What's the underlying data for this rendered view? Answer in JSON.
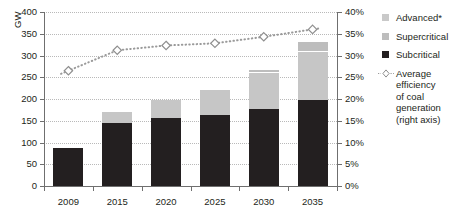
{
  "chart_data": {
    "type": "bar",
    "subtype": "stacked-bar-with-line",
    "title": "",
    "xlabel": "",
    "ylabel": "GW",
    "y2label": "",
    "categories": [
      "2009",
      "2015",
      "2020",
      "2025",
      "2030",
      "2035"
    ],
    "ylim": [
      0,
      400
    ],
    "yticks": [
      0,
      50,
      100,
      150,
      200,
      250,
      300,
      350,
      400
    ],
    "ytick_labels": [
      "0",
      "50",
      "100",
      "150",
      "200",
      "250",
      "300",
      "350",
      "400"
    ],
    "y2lim": [
      0,
      40
    ],
    "y2ticks": [
      0,
      5,
      10,
      15,
      20,
      25,
      30,
      35,
      40
    ],
    "y2tick_labels": [
      "0%",
      "5%",
      "10%",
      "15%",
      "20%",
      "25%",
      "30%",
      "35%",
      "40%"
    ],
    "grid": true,
    "legend_position": "right",
    "series": [
      {
        "name": "Subcritical",
        "axis": "left",
        "color": "#231f20",
        "values": [
          88,
          145,
          157,
          163,
          176,
          197
        ]
      },
      {
        "name": "Supercritical",
        "axis": "left",
        "color": "#c6c6c6",
        "values": [
          0,
          25,
          40,
          57,
          85,
          112
        ]
      },
      {
        "name": "Advanced*",
        "axis": "left",
        "color": "#bdbdbd",
        "values": [
          0,
          0,
          0,
          0,
          6,
          22
        ]
      },
      {
        "name": "Average efficiency of coal generation (right axis)",
        "axis": "right",
        "color": "#9a9a9a",
        "marker": "open-diamond",
        "linestyle": "dotted",
        "values": [
          26.5,
          31.2,
          32.3,
          32.8,
          34.3,
          36.0
        ]
      }
    ],
    "totals": [
      88,
      170,
      197,
      220,
      267,
      331
    ]
  },
  "legend": {
    "items": [
      {
        "label": "Advanced*",
        "swatch": "light-gray-swatch"
      },
      {
        "label": "Supercritical",
        "swatch": "medium-gray-swatch"
      },
      {
        "label": "Subcritical",
        "swatch": "black-swatch"
      }
    ],
    "line_entry": {
      "line1": "Average efficiency",
      "line2": "of coal generation",
      "line3": "(right axis)"
    }
  },
  "colors": {
    "subcritical": "#231f20",
    "supercritical": "#c6c6c6",
    "advanced": "#bdbdbd",
    "line": "#9a9a9a",
    "grid": "#b9b9b9",
    "axis": "#6f6f6f",
    "background": "#ffffff"
  }
}
